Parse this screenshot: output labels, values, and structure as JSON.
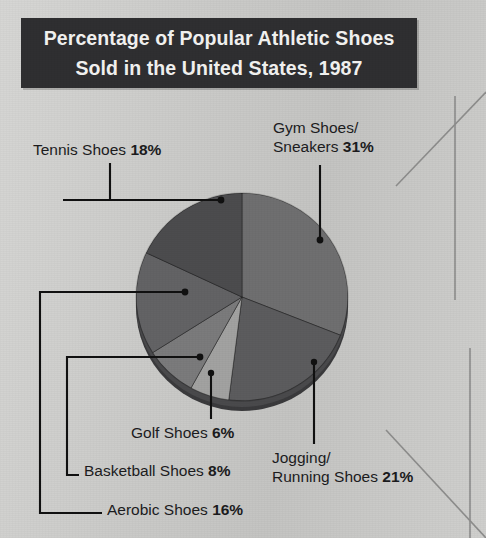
{
  "banner": {
    "line1": "Percentage of Popular Athletic Shoes",
    "line2": "Sold in the United States, 1987",
    "background": "#2f2f31",
    "text_color": "#f3f3f1"
  },
  "page": {
    "background": "#cacac8"
  },
  "chart_data": {
    "type": "pie",
    "title": "Percentage of Popular Athletic Shoes Sold in the United States, 1987",
    "units": "percent",
    "total": 100,
    "legend": "none",
    "grid": false,
    "style": "3d-pie-with-leader-lines",
    "categories": [
      "Gym Shoes/Sneakers",
      "Jogging/Running Shoes",
      "Tennis Shoes",
      "Aerobic Shoes",
      "Basketball Shoes",
      "Golf Shoes"
    ],
    "values": [
      31,
      21,
      18,
      16,
      8,
      6
    ],
    "slices": [
      {
        "name": "Gym Shoes/Sneakers",
        "label_line1": "Gym Shoes/",
        "label_line2": "Sneakers",
        "value": 31,
        "value_text": "31%",
        "color": "#6f6f70",
        "start_deg": 0,
        "end_deg": 111.6
      },
      {
        "name": "Jogging/Running Shoes",
        "label_line1": "Jogging/",
        "label_line2": "Running Shoes",
        "value": 21,
        "value_text": "21%",
        "color": "#5c5c5e",
        "start_deg": 111.6,
        "end_deg": 187.2
      },
      {
        "name": "Golf Shoes",
        "label_line1": "Golf Shoes",
        "label_line2": "",
        "value": 6,
        "value_text": "6%",
        "color": "#a2a2a1",
        "start_deg": 187.2,
        "end_deg": 208.8
      },
      {
        "name": "Basketball Shoes",
        "label_line1": "Basketball Shoes",
        "label_line2": "",
        "value": 8,
        "value_text": "8%",
        "color": "#7b7b7c",
        "start_deg": 208.8,
        "end_deg": 237.6
      },
      {
        "name": "Aerobic Shoes",
        "label_line1": "Aerobic Shoes",
        "label_line2": "",
        "value": 16,
        "value_text": "16%",
        "color": "#636365",
        "start_deg": 237.6,
        "end_deg": 295.2
      },
      {
        "name": "Tennis Shoes",
        "label_line1": "Tennis Shoes",
        "label_line2": "",
        "value": 18,
        "value_text": "18%",
        "color": "#4c4c4e",
        "start_deg": 295.2,
        "end_deg": 360
      }
    ]
  }
}
